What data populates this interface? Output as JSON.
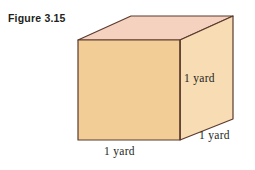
{
  "figure": {
    "caption": "Figure 3.15",
    "background_color": "#ffffff",
    "ink_color": "#231f20"
  },
  "cube": {
    "front_face_color": "#f2ce96",
    "top_face_color": "#f5d2c0",
    "right_face_color": "#f7dcb4",
    "edge_color": "#5c3a2e",
    "front_face": {
      "left": 78,
      "top": 40,
      "right": 180,
      "bottom": 140
    },
    "depth_offset": {
      "x": 53,
      "y": -24
    }
  },
  "labels": {
    "height": "1 yard",
    "width": "1 yard",
    "depth": "1 yard"
  }
}
